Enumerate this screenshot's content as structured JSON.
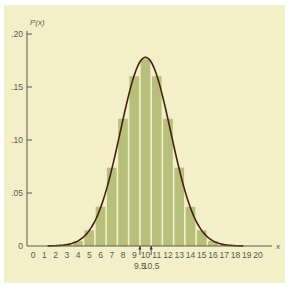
{
  "chart_data": {
    "type": "bar",
    "subtype": "histogram-with-normal-curve-overlay",
    "title": "",
    "xlabel": "x",
    "ylabel": "P(x)",
    "xlim": [
      0,
      20
    ],
    "ylim": [
      0,
      0.2
    ],
    "grid": false,
    "legend": null,
    "x_ticks": [
      "0",
      "1",
      "2",
      "3",
      "4",
      "5",
      "6",
      "7",
      "8",
      "9",
      "10",
      "11",
      "12",
      "13",
      "14",
      "15",
      "16",
      "17",
      "18",
      "19",
      "20"
    ],
    "y_ticks": [
      ".20",
      ".15",
      ".10",
      ".05",
      "0"
    ],
    "y_tick_values": [
      0.2,
      0.15,
      0.1,
      0.05,
      0
    ],
    "annotations": [
      {
        "text": "9.5",
        "x": 9.5,
        "marker": "arrow-up-tick"
      },
      {
        "text": "10.5",
        "x": 10.5,
        "marker": "arrow-up-tick"
      }
    ],
    "categories": [
      0,
      1,
      2,
      3,
      4,
      5,
      6,
      7,
      8,
      9,
      10,
      11,
      12,
      13,
      14,
      15,
      16,
      17,
      18,
      19,
      20
    ],
    "values": [
      0.0,
      0.0,
      0.0002,
      0.0011,
      0.0046,
      0.0148,
      0.037,
      0.0739,
      0.1201,
      0.1602,
      0.1762,
      0.1602,
      0.1201,
      0.0739,
      0.037,
      0.0148,
      0.0046,
      0.0011,
      0.0002,
      0.0,
      0.0
    ],
    "curve": {
      "type": "normal",
      "mean": 10,
      "sd": 2.236,
      "peak": 0.178,
      "x_range": [
        1.3,
        18.7
      ]
    },
    "colors": {
      "bars": "#b7c07a",
      "bar_gap": "#e8e6b8",
      "curve": "#4a1f12",
      "axis": "#5a5a4a",
      "background": "#f3efc9"
    }
  }
}
